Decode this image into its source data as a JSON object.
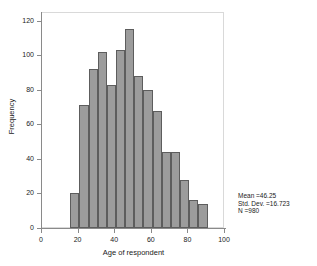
{
  "chart_data": {
    "type": "bar",
    "title": "",
    "subtitle": "",
    "xlabel": "Age of respondent",
    "ylabel": "Frequency",
    "xlim": [
      0,
      100
    ],
    "ylim": [
      0,
      125
    ],
    "grid": false,
    "legend": false,
    "bin_width": 5,
    "categories": [
      "16",
      "21",
      "26",
      "31",
      "36",
      "41",
      "46",
      "51",
      "56",
      "61",
      "66",
      "71",
      "76",
      "81",
      "86"
    ],
    "bin_starts": [
      16,
      21,
      26,
      31,
      36,
      41,
      46,
      51,
      56,
      61,
      66,
      71,
      76,
      81,
      86
    ],
    "bin_ends": [
      21,
      26,
      31,
      36,
      41,
      46,
      51,
      56,
      61,
      66,
      71,
      76,
      81,
      86,
      91
    ],
    "values": [
      20,
      71,
      92,
      102,
      83,
      103,
      115,
      88,
      80,
      68,
      44,
      44,
      28,
      16,
      14
    ],
    "y_ticks": [
      "0",
      "20",
      "40",
      "60",
      "80",
      "100",
      "120"
    ],
    "y_tick_values": [
      0,
      20,
      40,
      60,
      80,
      100,
      120
    ],
    "x_ticks": [
      "0",
      "20",
      "40",
      "60",
      "80",
      "100"
    ],
    "x_tick_values": [
      0,
      20,
      40,
      60,
      80,
      100
    ],
    "bar_color": "#9c9c9c",
    "bar_border_color": "#5d5d5d",
    "axis_color": "#8a8a8a",
    "frame_color": "#d9d9d9",
    "text_color": "#1a1a1a"
  },
  "annotations": {
    "mean": "Mean =46.25",
    "std_dev": "Std. Dev. =16.723",
    "n": "N =980"
  }
}
